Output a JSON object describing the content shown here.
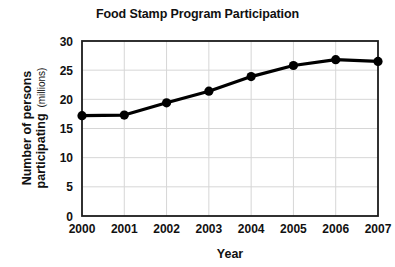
{
  "chart_data": {
    "type": "line",
    "title": "Food Stamp Program Participation",
    "xlabel": "Year",
    "ylabel": "Number of persons participating",
    "ylabel_unit": "(millions)",
    "categories": [
      "2000",
      "2001",
      "2002",
      "2003",
      "2004",
      "2005",
      "2006",
      "2007"
    ],
    "values": [
      17.2,
      17.3,
      19.4,
      21.4,
      23.9,
      25.8,
      26.8,
      26.5
    ],
    "series": [
      {
        "name": "Number of persons participating (millions)",
        "values": [
          17.2,
          17.3,
          19.4,
          21.4,
          23.9,
          25.8,
          26.8,
          26.5
        ]
      }
    ],
    "ylim": [
      0,
      30
    ],
    "yticks": [
      "0",
      "5",
      "10",
      "15",
      "20",
      "25",
      "30"
    ],
    "xticks": [
      "2000",
      "2001",
      "2002",
      "2003",
      "2004",
      "2005",
      "2006",
      "2007"
    ],
    "grid": true,
    "legend": "none",
    "colors": {
      "line": "#000000",
      "marker": "#000000",
      "grid": "#d6d6d6",
      "frame": "#1b1b1b",
      "background": "#ffffff",
      "text": "#111111"
    }
  }
}
